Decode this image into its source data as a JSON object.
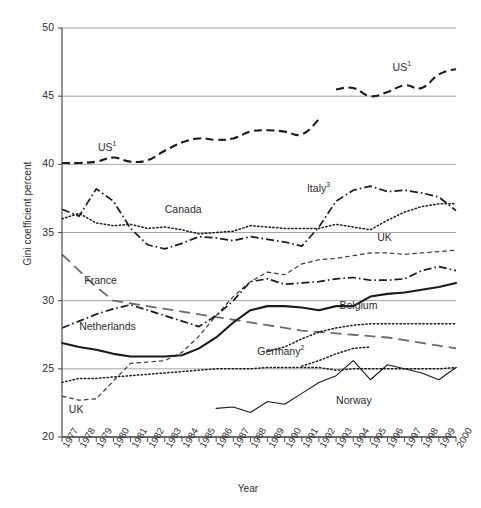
{
  "chart_data": {
    "type": "line",
    "title": "",
    "xlabel": "Year",
    "ylabel": "Gini coefficient percent",
    "xlim": [
      1977,
      2000
    ],
    "ylim": [
      20,
      50
    ],
    "yticks": [
      20,
      25,
      30,
      35,
      40,
      45,
      50
    ],
    "grid": "horizontal",
    "legend": "inline-labels",
    "x": [
      1977,
      1978,
      1979,
      1980,
      1981,
      1982,
      1983,
      1984,
      1985,
      1986,
      1987,
      1988,
      1989,
      1990,
      1991,
      1992,
      1993,
      1994,
      1995,
      1996,
      1997,
      1998,
      1999,
      2000
    ],
    "series": [
      {
        "name": "US",
        "label": "US",
        "superscript": "1",
        "style": "dashed-bold",
        "color": "#1a1a1a",
        "segments": [
          {
            "x": [
              1977,
              1978,
              1979,
              1980,
              1981,
              1982,
              1983,
              1984,
              1985,
              1986,
              1987,
              1988,
              1989,
              1990,
              1991,
              1992
            ],
            "values": [
              40.1,
              40.1,
              40.2,
              40.5,
              40.2,
              40.3,
              41.0,
              41.6,
              41.9,
              41.8,
              41.9,
              42.4,
              42.5,
              42.4,
              42.2,
              43.3
            ]
          },
          {
            "x": [
              1993,
              1994,
              1995,
              1996,
              1997,
              1998,
              1999,
              2000
            ],
            "values": [
              45.5,
              45.6,
              45.0,
              45.3,
              45.8,
              45.6,
              46.6,
              47.0
            ]
          }
        ],
        "label_positions": [
          {
            "x": 1979.1,
            "y": 41.2
          },
          {
            "x": 1996.3,
            "y": 47.1
          }
        ]
      },
      {
        "name": "Canada",
        "label": "Canada",
        "superscript": "",
        "style": "dotted",
        "color": "#1a1a1a",
        "values": [
          36.0,
          36.4,
          35.7,
          35.5,
          35.6,
          35.3,
          35.4,
          35.2,
          34.9,
          35.0,
          35.1,
          35.5,
          35.4,
          35.3,
          35.3,
          35.3,
          35.6,
          35.4,
          35.2,
          35.9,
          36.5,
          36.9,
          37.1,
          37.1
        ],
        "label_positions": [
          {
            "x": 1983.0,
            "y": 36.6
          }
        ]
      },
      {
        "name": "Italy",
        "label": "Italy",
        "superscript": "3",
        "style": "dash-dot",
        "color": "#1a1a1a",
        "values": [
          36.7,
          36.2,
          38.2,
          37.3,
          35.3,
          34.1,
          33.8,
          34.2,
          34.7,
          34.6,
          34.4,
          34.7,
          34.5,
          34.3,
          34.0,
          35.4,
          37.3,
          38.1,
          38.4,
          38.0,
          38.1,
          37.9,
          37.6,
          36.6
        ],
        "label_positions": [
          {
            "x": 1991.3,
            "y": 38.2
          }
        ]
      },
      {
        "name": "UK",
        "label": "UK",
        "superscript": "",
        "style": "dashed-fine",
        "color": "#3a3a3a",
        "values": [
          23.0,
          22.7,
          22.8,
          24.1,
          25.4,
          25.5,
          25.6,
          26.2,
          27.4,
          28.9,
          30.3,
          31.4,
          32.1,
          31.9,
          32.7,
          33.0,
          33.1,
          33.3,
          33.5,
          33.5,
          33.4,
          33.5,
          33.6,
          33.7
        ],
        "label_positions": [
          {
            "x": 1977.4,
            "y": 21.9
          },
          {
            "x": 1995.4,
            "y": 34.5
          }
        ]
      },
      {
        "name": "France",
        "label": "France",
        "superscript": "",
        "style": "long-dash",
        "color": "#6a6a6a",
        "values": [
          33.4,
          32.2,
          31.0,
          30.0,
          29.8,
          29.6,
          29.4,
          29.2,
          29.0,
          28.8,
          28.6,
          28.4,
          28.2,
          28.0,
          27.8,
          27.7,
          27.6,
          27.5,
          27.4,
          27.3,
          27.1,
          26.9,
          26.7,
          26.5
        ],
        "label_positions": [
          {
            "x": 1978.3,
            "y": 31.4
          }
        ]
      },
      {
        "name": "Netherlands",
        "label": "Netherlands",
        "superscript": "",
        "style": "dash-dot",
        "color": "#1a1a1a",
        "values": [
          28.0,
          28.5,
          29.0,
          29.4,
          29.7,
          29.3,
          28.9,
          28.5,
          28.1,
          28.9,
          30.0,
          31.4,
          31.6,
          31.2,
          31.3,
          31.4,
          31.6,
          31.7,
          31.5,
          31.5,
          31.6,
          32.2,
          32.5,
          32.2
        ],
        "label_positions": [
          {
            "x": 1978.0,
            "y": 28.0
          }
        ]
      },
      {
        "name": "Belgium",
        "label": "Belgium",
        "superscript": "",
        "style": "solid-bold",
        "color": "#1a1a1a",
        "values": [
          26.9,
          26.6,
          26.4,
          26.1,
          25.9,
          25.9,
          25.9,
          26.0,
          26.5,
          27.3,
          28.4,
          29.3,
          29.6,
          29.6,
          29.5,
          29.3,
          29.6,
          29.6,
          30.3,
          30.5,
          30.6,
          30.8,
          31.0,
          31.3
        ],
        "label_positions": [
          {
            "x": 1993.2,
            "y": 29.5
          }
        ]
      },
      {
        "name": "Germany",
        "label": "Germany",
        "superscript": "2",
        "style": "dotted",
        "color": "#1a1a1a",
        "values": [
          24.0,
          24.3,
          24.3,
          24.4,
          24.5,
          24.6,
          24.7,
          24.8,
          24.9,
          25.0,
          25.0,
          25.0,
          25.1,
          25.1,
          25.1,
          25.1,
          24.9,
          25.0,
          25.0,
          25.0,
          25.0,
          25.0,
          25.0,
          25.1
        ],
        "label_positions": [
          {
            "x": 1988.4,
            "y": 26.2
          }
        ]
      },
      {
        "name": "Germany-east",
        "label": "",
        "superscript": "",
        "style": "dotted",
        "color": "#1a1a1a",
        "segments": [
          {
            "x": [
              1989,
              1990,
              1991,
              1992,
              1993,
              1994,
              1995,
              1996,
              1997,
              1998,
              1999,
              2000
            ],
            "values": [
              26.3,
              26.6,
              27.2,
              27.7,
              28.0,
              28.2,
              28.3,
              28.3,
              28.3,
              28.3,
              28.3,
              28.3
            ]
          }
        ],
        "label_positions": []
      },
      {
        "name": "Germany-lower",
        "label": "",
        "superscript": "",
        "style": "dotted",
        "color": "#1a1a1a",
        "segments": [
          {
            "x": [
              1991,
              1992,
              1993,
              1994,
              1995
            ],
            "values": [
              25.2,
              25.6,
              26.1,
              26.5,
              26.6
            ]
          }
        ],
        "label_positions": []
      },
      {
        "name": "Norway",
        "label": "Norway",
        "superscript": "",
        "style": "solid-thin",
        "color": "#1a1a1a",
        "segments": [
          {
            "x": [
              1986,
              1987,
              1988,
              1989,
              1990,
              1991,
              1992,
              1993,
              1994,
              1995,
              1996,
              1997,
              1998,
              1999,
              2000
            ],
            "values": [
              22.1,
              22.2,
              21.8,
              22.6,
              22.4,
              23.2,
              24.0,
              24.5,
              25.6,
              24.2,
              25.3,
              25.0,
              24.7,
              24.2,
              25.1
            ]
          }
        ],
        "label_positions": [
          {
            "x": 1993.0,
            "y": 22.6
          }
        ]
      }
    ]
  },
  "axes": {
    "y_tick_labels": [
      "50",
      "45",
      "40",
      "35",
      "30",
      "25",
      "20"
    ],
    "x_tick_labels": [
      "1977",
      "1978",
      "1979",
      "1980",
      "1981",
      "1982",
      "1983",
      "1984",
      "1985",
      "1986",
      "1987",
      "1988",
      "1989",
      "1990",
      "1991",
      "1992",
      "1993",
      "1994",
      "1995",
      "1996",
      "1997",
      "1998",
      "1999",
      "2000"
    ],
    "y_title": "Gini coefficient percent",
    "x_title": "Year"
  },
  "colors": {
    "axis": "#4d4d4d",
    "grid": "#9a9a9a",
    "line_dark": "#1a1a1a",
    "line_gray": "#6a6a6a",
    "text": "#2b2b2b",
    "background": "#ffffff"
  }
}
